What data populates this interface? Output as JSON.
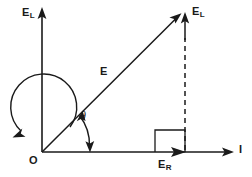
{
  "diagram": {
    "type": "vector-phasor-diagram",
    "background_color": "#ffffff",
    "stroke_color": "#1a1a1a",
    "labels": {
      "vertical_axis": {
        "base": "E",
        "sub": "L"
      },
      "resultant_tip": {
        "base": "E",
        "sub": "L"
      },
      "resultant_vector": "E",
      "angle": "θ",
      "horizontal_component": {
        "base": "E",
        "sub": "R"
      },
      "origin": "O",
      "horizontal_axis": "I"
    },
    "geometry": {
      "origin": {
        "x": 42,
        "y": 152
      },
      "vertical_axis_top": {
        "x": 42,
        "y": 8
      },
      "horizontal_axis_right": {
        "x": 233,
        "y": 152
      },
      "vector_tip": {
        "x": 181,
        "y": 14
      },
      "projection_x": 185,
      "angle_arc_radius": 48,
      "sweep_arc_radius": 33,
      "right_angle_square": {
        "x": 155,
        "y": 130,
        "size": 22
      }
    },
    "elements": [
      "vertical-axis",
      "horizontal-axis",
      "resultant-vector",
      "angle-arc",
      "rotation-sweep-arc",
      "projection-dashed-line",
      "vertical-component-arrow",
      "horizontal-component-arrow",
      "right-angle-marker"
    ]
  }
}
